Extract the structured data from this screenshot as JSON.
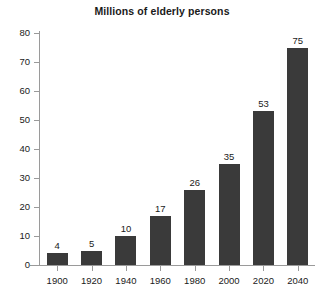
{
  "chart_data": {
    "type": "bar",
    "title": "Millions of elderly persons",
    "xlabel": "",
    "ylabel": "",
    "categories": [
      "1900",
      "1920",
      "1940",
      "1960",
      "1980",
      "2000",
      "2020",
      "2040"
    ],
    "values": [
      4,
      5,
      10,
      17,
      26,
      35,
      53,
      75
    ],
    "data_labels": [
      "4",
      "5",
      "10",
      "17",
      "26",
      "35",
      "53",
      "75"
    ],
    "ylim": [
      0,
      80
    ],
    "ytick_labels": [
      "0",
      "10",
      "20",
      "30",
      "40",
      "50",
      "60",
      "70",
      "80"
    ],
    "ytick_values": [
      0,
      10,
      20,
      30,
      40,
      50,
      60,
      70,
      80
    ],
    "grid": false,
    "legend": false,
    "bar_color": "#3a3a3a",
    "axis_color": "#9a9a9a",
    "background_color": "#ffffff",
    "text_color": "#1a1a1a"
  }
}
